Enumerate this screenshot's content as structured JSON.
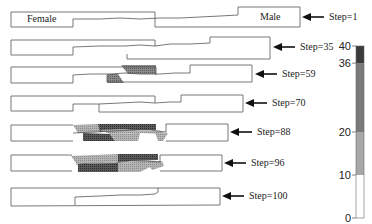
{
  "labels": {
    "left_region": "Female",
    "right_region": "Male"
  },
  "steps": [
    {
      "label": "Step=1",
      "step": 1
    },
    {
      "label": "Step=35",
      "step": 35
    },
    {
      "label": "Step=59",
      "step": 59
    },
    {
      "label": "Step=70",
      "step": 70
    },
    {
      "label": "Step=88",
      "step": 88
    },
    {
      "label": "Step=96",
      "step": 96
    },
    {
      "label": "Step=100",
      "step": 100
    }
  ],
  "colorbar": {
    "ticks": [
      "0",
      "10",
      "20",
      "36",
      "40"
    ],
    "tick_values": [
      0,
      10,
      20,
      36,
      40
    ],
    "bands": [
      {
        "from": 0,
        "to": 10,
        "color": "#ffffff"
      },
      {
        "from": 10,
        "to": 20,
        "color": "#a8a8a8"
      },
      {
        "from": 20,
        "to": 36,
        "color": "#7a7a7a"
      },
      {
        "from": 36,
        "to": 40,
        "color": "#3a3a3a"
      }
    ]
  },
  "colors": {
    "outline": "#555555",
    "arrow": "#111111"
  }
}
